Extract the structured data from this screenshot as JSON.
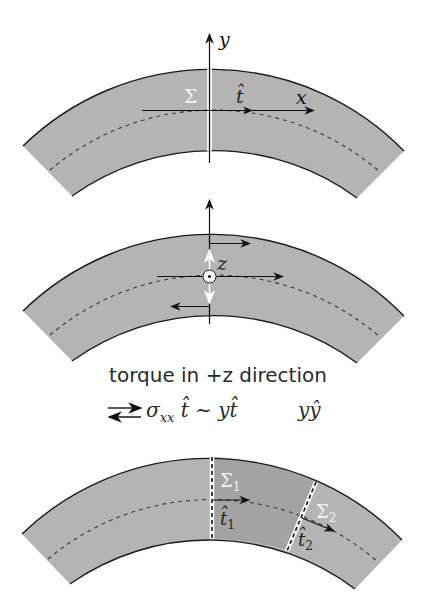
{
  "colors": {
    "band_fill": "#b4b4b4",
    "band_fill_dark": "#a3a3a3",
    "edge": "#1a1a1a",
    "background": "#ffffff",
    "highlight": "#ffffff"
  },
  "panel_top": {
    "y_axis_label": "y",
    "x_axis_label": "x",
    "surface_label": "Σ",
    "tangent_label": "t̂"
  },
  "panel_middle": {
    "z_axis_label": "z",
    "z_axis_icon": "out-of-page-dot"
  },
  "caption": {
    "line1": "torque in +z direction",
    "line2_arrow_icon": "opposing-arrows",
    "line2_expr": "σ",
    "line2_sub": "xx",
    "line2_rest": "t̂ ∼ yt̂",
    "line2_right": "yŷ"
  },
  "panel_bottom": {
    "surface1_label": "Σ",
    "surface1_sub": "1",
    "surface2_label": "Σ",
    "surface2_sub": "2",
    "tangent1_label": "t̂",
    "tangent1_sub": "1",
    "tangent2_label": "t̂",
    "tangent2_sub": "2"
  }
}
